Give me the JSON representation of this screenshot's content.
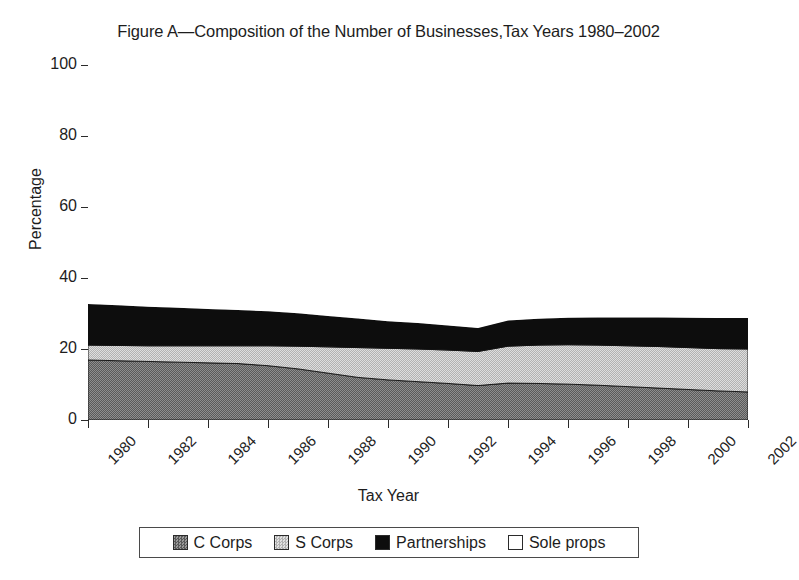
{
  "chart_data": {
    "type": "area",
    "title": "Figure A—Composition of the Number of Businesses,Tax Years 1980–2002",
    "xlabel": "Tax Year",
    "ylabel": "Percentage",
    "ylim": [
      0,
      100
    ],
    "yticks": [
      0,
      20,
      40,
      60,
      80,
      100
    ],
    "ytick_labels": [
      "0",
      "20",
      "40",
      "60",
      "80",
      "100"
    ],
    "xlim": [
      1980,
      2002
    ],
    "xticks": [
      1980,
      1982,
      1984,
      1986,
      1988,
      1990,
      1992,
      1994,
      1996,
      1998,
      2000,
      2002
    ],
    "xtick_labels": [
      "1980",
      "1982",
      "1984",
      "1986",
      "1988",
      "1990",
      "1992",
      "1994",
      "1996",
      "1998",
      "2000",
      "2002"
    ],
    "grid": false,
    "stacked": true,
    "legend_position": "bottom",
    "x": [
      1980,
      1981,
      1982,
      1983,
      1984,
      1985,
      1986,
      1987,
      1988,
      1989,
      1990,
      1991,
      1992,
      1993,
      1994,
      1995,
      1996,
      1997,
      1998,
      1999,
      2000,
      2001,
      2002
    ],
    "series": [
      {
        "name": "C Corps",
        "color": "#7c7c7c",
        "pattern": "dark-gray-dither",
        "values": [
          16.9,
          16.7,
          16.5,
          16.3,
          16.1,
          15.9,
          15.3,
          14.4,
          13.2,
          12.0,
          11.3,
          10.8,
          10.3,
          9.7,
          10.4,
          10.3,
          10.1,
          9.8,
          9.4,
          9.0,
          8.6,
          8.2,
          7.9
        ]
      },
      {
        "name": "S Corps",
        "color": "#c9c9c9",
        "pattern": "light-gray-dither",
        "values": [
          4.2,
          4.3,
          4.4,
          4.6,
          4.8,
          5.0,
          5.6,
          6.4,
          7.4,
          8.4,
          8.9,
          9.2,
          9.4,
          9.6,
          10.4,
          10.8,
          11.1,
          11.3,
          11.5,
          11.7,
          11.8,
          11.9,
          12.1
        ]
      },
      {
        "name": "Partnerships",
        "color": "#0d0d0d",
        "pattern": "solid-black",
        "values": [
          11.6,
          11.3,
          11.0,
          10.7,
          10.4,
          10.1,
          9.7,
          9.3,
          8.7,
          8.2,
          7.6,
          7.3,
          6.9,
          6.6,
          7.2,
          7.4,
          7.6,
          7.8,
          8.0,
          8.2,
          8.4,
          8.6,
          8.7
        ]
      },
      {
        "name": "Sole props",
        "color": "#ffffff",
        "pattern": "white",
        "values": [
          67.3,
          67.7,
          68.1,
          68.4,
          68.7,
          69.0,
          69.4,
          69.9,
          70.7,
          71.4,
          72.2,
          72.7,
          73.4,
          74.1,
          72.0,
          71.5,
          71.2,
          71.1,
          71.1,
          71.1,
          71.2,
          71.3,
          71.3
        ]
      }
    ],
    "cumulative_tops": {
      "c_corps": [
        16.9,
        16.7,
        16.5,
        16.3,
        16.1,
        15.9,
        15.3,
        14.4,
        13.2,
        12.0,
        11.3,
        10.8,
        10.3,
        9.7,
        10.4,
        10.3,
        10.1,
        9.8,
        9.4,
        9.0,
        8.6,
        8.2,
        7.9
      ],
      "s_corps": [
        21.1,
        21.0,
        20.9,
        20.9,
        20.9,
        20.9,
        20.9,
        20.8,
        20.6,
        20.4,
        20.2,
        20.0,
        19.7,
        19.3,
        20.8,
        21.1,
        21.2,
        21.1,
        20.9,
        20.7,
        20.4,
        20.1,
        20.0
      ],
      "partnerships": [
        32.7,
        32.3,
        31.9,
        31.6,
        31.3,
        31.0,
        30.6,
        30.1,
        29.3,
        28.6,
        27.8,
        27.3,
        26.6,
        25.9,
        28.0,
        28.5,
        28.8,
        28.9,
        28.9,
        28.9,
        28.8,
        28.7,
        28.7
      ]
    }
  },
  "legend": {
    "items": [
      {
        "label": "C Corps",
        "swatch": "dark-gray-dither"
      },
      {
        "label": "S Corps",
        "swatch": "light-gray-dither"
      },
      {
        "label": "Partnerships",
        "swatch": "solid-black"
      },
      {
        "label": "Sole props",
        "swatch": "white"
      }
    ]
  }
}
